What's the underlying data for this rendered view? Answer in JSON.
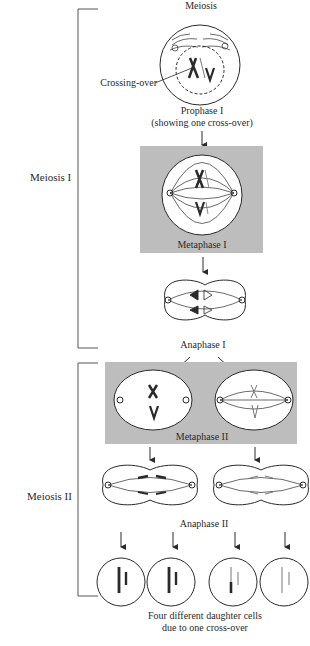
{
  "diagram": {
    "title": "Meiosis",
    "colors": {
      "ink": "#2a2a2a",
      "panel_shade": "#bdbdbd",
      "cell_fill": "#ffffff",
      "bracket": "#555555"
    },
    "sections": [
      {
        "label": "Meiosis I"
      },
      {
        "label": "Meiosis II"
      }
    ],
    "annotations": {
      "crossing_over": "Crossing-over"
    },
    "stages": {
      "prophase1": {
        "label": "Prophase I",
        "sublabel": "(showing one cross-over)"
      },
      "metaphase1": {
        "label": "Metaphase I"
      },
      "anaphase1": {
        "label": "Anaphase I"
      },
      "metaphase2": {
        "label": "Metaphase II"
      },
      "anaphase2": {
        "label": "Anaphase II"
      },
      "daughters": {
        "label_line1": "Four different daughter cells",
        "label_line2": "due to one cross-over"
      }
    }
  }
}
